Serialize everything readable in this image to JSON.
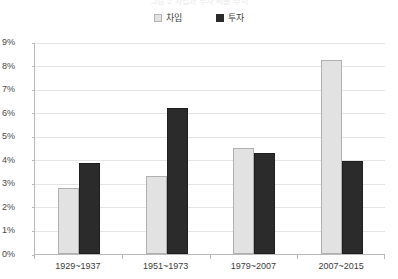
{
  "title": {
    "text": "그림 2  차입과 투자 비율 추이"
  },
  "legend": {
    "position": "top-center",
    "entries": [
      {
        "label": "차입",
        "color": "#e2e2e2",
        "swatch": "light-square-icon"
      },
      {
        "label": "투자",
        "color": "#2b2b2b",
        "swatch": "dark-square-icon"
      }
    ]
  },
  "axis": {
    "y_ticks": [
      "9%",
      "8%",
      "7%",
      "6%",
      "5%",
      "4%",
      "3%",
      "2%",
      "1%",
      "0%"
    ],
    "x_labels": [
      "1929~1937",
      "1951~1973",
      "1979~2007",
      "2007~2015"
    ]
  },
  "colors": {
    "series_light": "#e2e2e2",
    "series_light_border": "#b0b0b0",
    "series_dark": "#2b2b2b",
    "axis_line": "#b9b9b9",
    "gridline": "#e4e4e4",
    "text": "#3d3d3d",
    "background": "#ffffff"
  },
  "chart_data": {
    "type": "bar",
    "title": "그림 2  차입과 투자 비율 추이",
    "xlabel": "",
    "ylabel": "",
    "ylim": [
      0,
      9
    ],
    "ytick_step": 1,
    "ytick_format": "percent",
    "grid": true,
    "legend_position": "top-center",
    "categories": [
      "1929~1937",
      "1951~1973",
      "1979~2007",
      "2007~2015"
    ],
    "series": [
      {
        "name": "차입",
        "color": "#e2e2e2",
        "values": [
          2.8,
          3.3,
          4.5,
          8.25
        ]
      },
      {
        "name": "투자",
        "color": "#2b2b2b",
        "values": [
          3.85,
          6.2,
          4.3,
          3.95
        ]
      }
    ]
  }
}
